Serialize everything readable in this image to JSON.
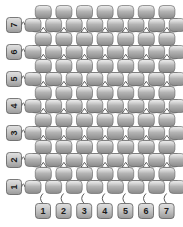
{
  "diagram": {
    "type": "beadwork-chart",
    "stitch": "even-count peyote",
    "canvas": {
      "width": 183,
      "height": 227
    },
    "background_color": "#ffffff",
    "bead": {
      "shape": "rounded-rectangle",
      "width": 16,
      "height": 13,
      "corner_radius": 4,
      "fill_top": "#e8e8e8",
      "fill_mid": "#b9b9b9",
      "fill_bottom": "#8f8f8f",
      "stroke": "#6e6e6e",
      "stroke_width": 0.7
    },
    "thread": {
      "color": "#4a4a4a",
      "width": 0.9,
      "style": "arcs-and-diamonds"
    },
    "label_chip": {
      "fill_top": "#dcdcdc",
      "fill_bottom": "#9a9a9a",
      "stroke": "#5c5c5c",
      "width": 15,
      "height": 15,
      "corner_radius": 3,
      "text_color": "#1a1a1a"
    },
    "grid": {
      "columns": 7,
      "rows": 7,
      "bead_rows_total": 14,
      "row_pitch": 13.6,
      "column_pitch": 20.6,
      "origin_x": 33,
      "origin_y": 12,
      "offset_x": 10.3
    },
    "row_labels": {
      "name": "row-number-labels",
      "position": "left",
      "rotation_deg": -90,
      "order_top_to_bottom": [
        "7",
        "6",
        "5",
        "4",
        "3",
        "2",
        "1"
      ],
      "x": 14,
      "y_positions": [
        25,
        52,
        79,
        106,
        133,
        160,
        187
      ]
    },
    "column_labels": {
      "name": "column-number-labels",
      "position": "bottom",
      "rotation_deg": 0,
      "order_left_to_right": [
        "1",
        "2",
        "3",
        "4",
        "5",
        "6",
        "7"
      ],
      "y": 211,
      "x_positions": [
        43,
        63.6,
        84.2,
        104.8,
        125.4,
        146,
        166.6
      ]
    },
    "bead_rows": [
      {
        "index": 0,
        "beads": 7,
        "offset": true,
        "y": 12
      },
      {
        "index": 1,
        "beads": 8,
        "offset": false,
        "y": 25
      },
      {
        "index": 2,
        "beads": 7,
        "offset": true,
        "y": 39
      },
      {
        "index": 3,
        "beads": 8,
        "offset": false,
        "y": 52
      },
      {
        "index": 4,
        "beads": 7,
        "offset": true,
        "y": 66
      },
      {
        "index": 5,
        "beads": 8,
        "offset": false,
        "y": 79
      },
      {
        "index": 6,
        "beads": 7,
        "offset": true,
        "y": 93
      },
      {
        "index": 7,
        "beads": 8,
        "offset": false,
        "y": 106
      },
      {
        "index": 8,
        "beads": 7,
        "offset": true,
        "y": 120
      },
      {
        "index": 9,
        "beads": 8,
        "offset": false,
        "y": 133
      },
      {
        "index": 10,
        "beads": 7,
        "offset": true,
        "y": 147
      },
      {
        "index": 11,
        "beads": 8,
        "offset": false,
        "y": 160
      },
      {
        "index": 12,
        "beads": 7,
        "offset": true,
        "y": 174
      },
      {
        "index": 13,
        "beads": 8,
        "offset": false,
        "y": 187
      }
    ]
  }
}
